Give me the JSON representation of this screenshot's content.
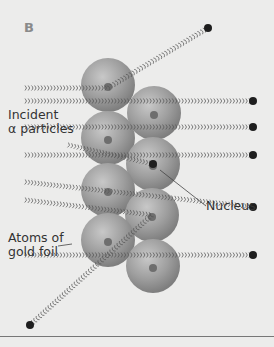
{
  "figure": {
    "panel_label": "B",
    "labels": {
      "incident_line1": "Incident",
      "incident_line2": "α particles",
      "nucleus": "Nucleus",
      "atoms_line1": "Atoms of",
      "atoms_line2": "gold foil"
    },
    "colors": {
      "background": "#ececeb",
      "atom": "#9a9a9a",
      "nucleus": "#6e6e6e",
      "track": "#555555",
      "particle": "#1e1e1e"
    },
    "atoms": [
      {
        "cx": 108,
        "cy": 85
      },
      {
        "cx": 154,
        "cy": 113
      },
      {
        "cx": 108,
        "cy": 138
      },
      {
        "cx": 153,
        "cy": 164
      },
      {
        "cx": 108,
        "cy": 190
      },
      {
        "cx": 152,
        "cy": 215
      },
      {
        "cx": 108,
        "cy": 240
      },
      {
        "cx": 153,
        "cy": 266
      }
    ],
    "tracks": [
      {
        "points": [
          [
            25,
            88
          ],
          [
            108,
            88
          ],
          [
            208,
            28
          ]
        ]
      },
      {
        "points": [
          [
            25,
            101
          ],
          [
            253,
            101
          ]
        ]
      },
      {
        "points": [
          [
            25,
            127
          ],
          [
            253,
            127
          ]
        ]
      },
      {
        "points": [
          [
            68,
            145
          ],
          [
            153,
            164
          ]
        ]
      },
      {
        "points": [
          [
            25,
            155
          ],
          [
            253,
            155
          ]
        ]
      },
      {
        "points": [
          [
            25,
            182
          ],
          [
            253,
            207
          ]
        ]
      },
      {
        "points": [
          [
            25,
            200
          ],
          [
            152,
            215
          ],
          [
            30,
            325
          ]
        ]
      },
      {
        "points": [
          [
            25,
            255
          ],
          [
            253,
            255
          ]
        ]
      }
    ]
  }
}
